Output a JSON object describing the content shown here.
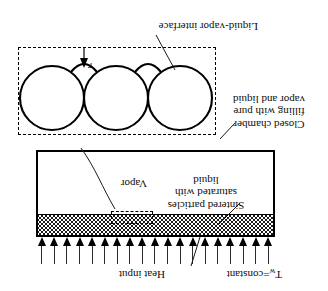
{
  "figure": {
    "orientation": "rotated-180",
    "kind": "vapor-chamber-wick-schematic",
    "labels": {
      "wall_temperature": "T",
      "wall_temperature_sub": "w",
      "wall_temperature_eq": "=constant",
      "heat_input": "Heat input",
      "wick_line1": "Sintered particles",
      "wick_line2": "saturated with",
      "wick_line3": "liquid",
      "vapor": "Vapor",
      "chamber_line1": "Closed chamber",
      "chamber_line2": "filling with pure",
      "chamber_line3": "vapor and liquid",
      "interface": "Liquid-vapor interface",
      "radius_symbol": "r"
    },
    "colors": {
      "ink": "#000000",
      "text": "#0d0d0d",
      "arrow": "#2b2b2b",
      "background": "#ffffff"
    },
    "arrows": {
      "count": 19,
      "label": "heat-input-arrow"
    },
    "particles": {
      "count": 3,
      "label": "sintered-particle"
    }
  }
}
